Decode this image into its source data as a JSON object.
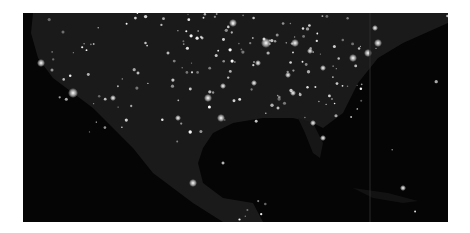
{
  "image": {
    "subject": "North America city lights at night (satellite view)",
    "background_color": "#ffffff",
    "photo_bg": "#050505",
    "land_tint": "#1c1c1c",
    "light_color": "#ffffff",
    "frame": {
      "x": 23,
      "y": 13,
      "width": 425,
      "height": 209
    }
  }
}
